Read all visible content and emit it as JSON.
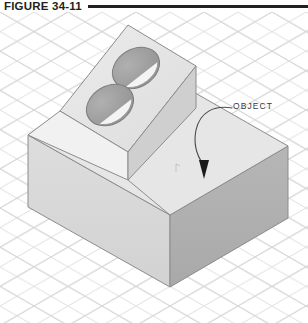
{
  "figure": {
    "caption": "FIGURE 34-11",
    "rule_color": "#231f20"
  },
  "callout": {
    "label": "OBJECT",
    "label_color": "#3a3a3c",
    "leader_color": "#4a4a4c",
    "arrow_color": "#1a1a1a"
  },
  "drawing": {
    "title": "isometric solid object on grid",
    "background_color": "#ffffff",
    "grid_color": "#d9d9dd",
    "object": {
      "name": "block-with-inclined-face-and-two-holes",
      "outline_color": "#8a8a8e",
      "faces": {
        "top_face_color": "#e9e9e9",
        "inclined_face_color": "#e2e2e2",
        "left_face_color": "#dcdcdc",
        "right_face_color": "#b3b3b3",
        "wedge_left_color": "#f0f0f0",
        "wedge_right_color": "#c9c9c9"
      },
      "holes": [
        {
          "name": "upper-hole",
          "cx": 136,
          "cy": 56,
          "rx": 24,
          "ry": 18,
          "fill": "#9a9a9a"
        },
        {
          "name": "lower-hole",
          "cx": 110,
          "cy": 93,
          "rx": 24,
          "ry": 18,
          "fill": "#9a9a9a"
        }
      ]
    }
  }
}
